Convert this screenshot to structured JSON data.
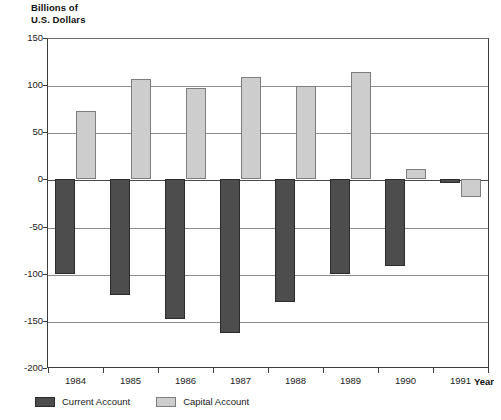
{
  "chart_data": {
    "type": "bar",
    "title": "",
    "subtitle": "",
    "ylabel": "Billions of\nU.S. Dollars",
    "xlabel": "Year",
    "categories": [
      "1984",
      "1985",
      "1986",
      "1987",
      "1988",
      "1989",
      "1990",
      "1991"
    ],
    "series": [
      {
        "name": "Current Account",
        "color": "#4d4d4d",
        "values": [
          -100,
          -123,
          -148,
          -163,
          -130,
          -100,
          -92,
          -4
        ]
      },
      {
        "name": "Capital Account",
        "color": "#cdcdcd",
        "values": [
          73,
          106,
          97,
          109,
          99,
          114,
          11,
          -19
        ]
      }
    ],
    "ylim": [
      -200,
      150
    ],
    "yticks": [
      150,
      100,
      50,
      0,
      -50,
      -100,
      -150,
      -200
    ],
    "ytick_labels": [
      "150",
      "100",
      "50",
      "0",
      "-50",
      "-100",
      "-150",
      "-200"
    ],
    "grid": true,
    "grid_axis": "y",
    "legend_position": "bottom-left",
    "zero_line": 0
  },
  "legend": {
    "items": [
      {
        "label": "Current Account",
        "swatch": "current"
      },
      {
        "label": "Capital Account",
        "swatch": "capital"
      }
    ]
  },
  "colors": {
    "current_account": "#4d4d4d",
    "capital_account": "#cdcdcd",
    "axis": "#3c3c3c",
    "gridline": "#8c8c8c",
    "background": "#ffffff"
  }
}
